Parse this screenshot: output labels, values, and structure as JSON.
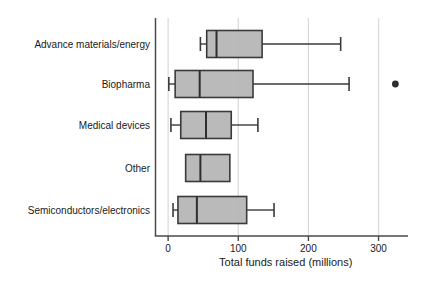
{
  "figure": {
    "background": "#ffffff"
  },
  "chart_data": {
    "type": "boxplot",
    "orientation": "horizontal",
    "title": "",
    "xlabel": "Total funds raised (millions)",
    "ylabel": "",
    "x_ticks": [
      0,
      100,
      200,
      300
    ],
    "xlim": [
      -18,
      342
    ],
    "grid": true,
    "legend": false,
    "categories": [
      "Advance materials/energy",
      "Biopharma",
      "Medical devices",
      "Other",
      "Semiconductors/electronics"
    ],
    "series": [
      {
        "category": "Advance materials/energy",
        "whisker_low": 46,
        "q1": 55,
        "median": 69,
        "q3": 134,
        "whisker_high": 246,
        "outliers": []
      },
      {
        "category": "Biopharma",
        "whisker_low": 1,
        "q1": 10,
        "median": 45,
        "q3": 121,
        "whisker_high": 258,
        "outliers": [
          324
        ]
      },
      {
        "category": "Medical devices",
        "whisker_low": 4,
        "q1": 18,
        "median": 54,
        "q3": 90,
        "whisker_high": 128,
        "outliers": []
      },
      {
        "category": "Other",
        "whisker_low": 25,
        "q1": 25,
        "median": 46,
        "q3": 88,
        "whisker_high": 88,
        "outliers": []
      },
      {
        "category": "Semiconductors/electronics",
        "whisker_low": 7,
        "q1": 14,
        "median": 41,
        "q3": 112,
        "whisker_high": 151,
        "outliers": []
      }
    ],
    "colors": {
      "box_fill": "#b4b4b4",
      "box_border": "#3a3a3a",
      "median": "#2e2e2e",
      "whisker": "#3a3a3a",
      "outlier": "#2e2e2e",
      "gridline": "#d8d8d8",
      "axis": "#4a4a4a",
      "text": "#1a1a1a",
      "background": "#ffffff"
    }
  }
}
